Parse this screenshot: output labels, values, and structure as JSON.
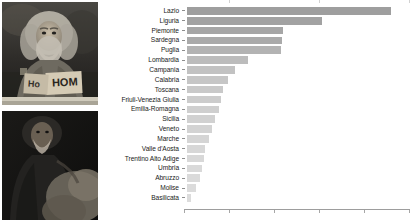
{
  "photos": [
    {
      "name": "homeless-man-with-sign-photo",
      "alt": "Black and white photograph of a bearded homeless man seated holding cardboard signs",
      "sign_text": "HOM",
      "sign_text_2": "Ho"
    },
    {
      "name": "seated-man-dark-photo",
      "alt": "Dark photograph of a bearded man in a hooded coat seated"
    }
  ],
  "chart_data": {
    "type": "bar",
    "orientation": "horizontal",
    "title": "",
    "xlabel": "",
    "ylabel": "",
    "grid": false,
    "legend": null,
    "categories": [
      "Lazio",
      "Liguria",
      "Piemonte",
      "Sardegna",
      "Puglia",
      "Lombardia",
      "Campania",
      "Calabria",
      "Toscana",
      "Friuli-Venezia Giulia",
      "Emilia-Romagna",
      "Sicilia",
      "Veneto",
      "Marche",
      "Valle d'Aosta",
      "Trentino Alto Adige",
      "Umbria",
      "Abruzzo",
      "Molise",
      "Basilicata"
    ],
    "values": [
      100.0,
      66.5,
      47.0,
      46.5,
      46.0,
      30.0,
      23.5,
      20.0,
      17.5,
      16.5,
      15.5,
      14.0,
      12.5,
      11.0,
      9.0,
      8.5,
      7.5,
      6.5,
      4.5,
      2.0
    ],
    "xlim": [
      0,
      113
    ],
    "xticks": [
      0,
      22.5,
      45,
      67.5,
      90,
      112.5
    ],
    "xticklabels": [
      "",
      "",
      "",
      "",
      "",
      ""
    ],
    "bar_colors": [
      "#9e9e9e",
      "#a2a2a2",
      "#a6a6a6",
      "#aaaaaa",
      "#b3b3b3",
      "#bcbcbc",
      "#c2c2c2",
      "#c6c6c6",
      "#c9c9c9",
      "#cccccc",
      "#cfcfcf",
      "#d1d1d1",
      "#d3d3d3",
      "#d5d5d5",
      "#d7d7d7",
      "#d8d8d8",
      "#d9d9d9",
      "#dadada",
      "#dbdbdb",
      "#dcdcdc"
    ],
    "axis_color": "#9d9d9d",
    "label_color": "#1a1a1a"
  }
}
